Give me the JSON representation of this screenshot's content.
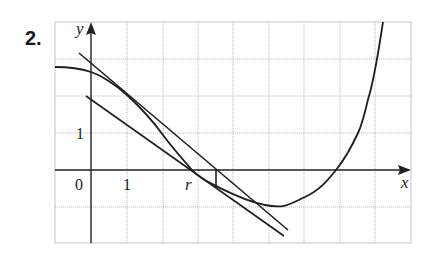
{
  "problem": {
    "number": "2."
  },
  "axes": {
    "x_label": "x",
    "y_label": "y",
    "origin_label": "0",
    "x_tick_label": "1",
    "y_tick_label": "1",
    "root_label": "r"
  },
  "grid": {
    "x_range": [
      -1,
      9
    ],
    "y_range": [
      -2,
      4
    ],
    "unit_px": 36
  },
  "figure": {
    "curve_color": "#1e1e1e",
    "grid_color": "#b8b8b8"
  }
}
